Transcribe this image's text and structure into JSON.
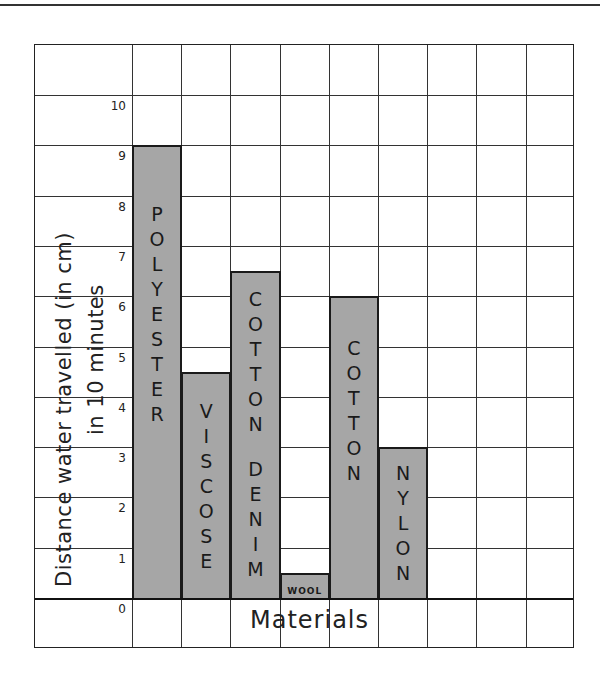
{
  "chart_data": {
    "type": "bar",
    "title": "",
    "xlabel": "Materials",
    "ylabel": "Distance water travelled (in cm) in 10 minutes",
    "ylabel_lines": [
      "Distance water travelled (in cm)",
      "in 10 minutes"
    ],
    "categories": [
      "POLYESTER",
      "VISCOSE",
      "COTTON DENIM",
      "WOOL",
      "COTTON",
      "NYLON"
    ],
    "values": [
      9,
      4.5,
      6.5,
      0.5,
      6,
      3
    ],
    "ylim": [
      0,
      10
    ],
    "yticks": [
      "0",
      "1",
      "2",
      "3",
      "4",
      "5",
      "6",
      "7",
      "8",
      "9",
      "10"
    ],
    "grid": true,
    "legend": null,
    "bar_color": "#a6a6a6",
    "bar_border_color": "#1a1a1a"
  },
  "bars": [
    {
      "label": "POLYESTER",
      "letters": [
        "P",
        "O",
        "L",
        "Y",
        "E",
        "S",
        "T",
        "E",
        "R"
      ],
      "value": 9
    },
    {
      "label": "VISCOSE",
      "letters": [
        "V",
        "I",
        "S",
        "C",
        "O",
        "S",
        "E"
      ],
      "value": 4.5
    },
    {
      "label": "COTTON DENIM",
      "letters": [
        "C",
        "O",
        "T",
        "T",
        "O",
        "N",
        "",
        "D",
        "E",
        "N",
        "I",
        "M"
      ],
      "value": 6.5
    },
    {
      "label": "WOOL",
      "letters": [
        "WOOL"
      ],
      "value": 0.5
    },
    {
      "label": "COTTON",
      "letters": [
        "C",
        "O",
        "T",
        "T",
        "O",
        "N"
      ],
      "value": 6
    },
    {
      "label": "NYLON",
      "letters": [
        "N",
        "Y",
        "L",
        "O",
        "N"
      ],
      "value": 3
    }
  ],
  "axis": {
    "ylabel_line1": "Distance water travelled (in cm)",
    "ylabel_line2": "in 10 minutes",
    "xlabel": "Materials",
    "ticks": [
      "10",
      "9",
      "8",
      "7",
      "6",
      "5",
      "4",
      "3",
      "2",
      "1",
      "0"
    ]
  }
}
